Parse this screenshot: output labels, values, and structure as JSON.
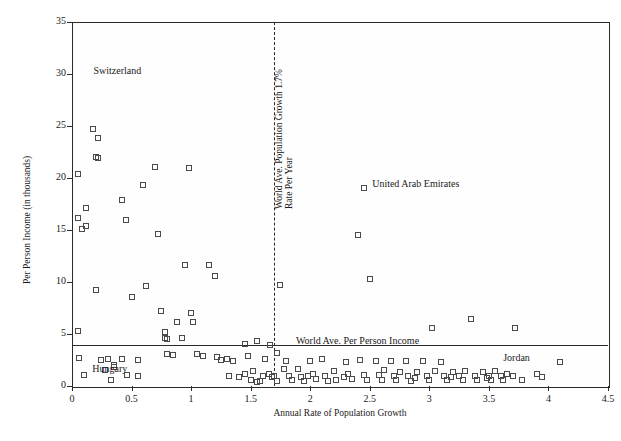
{
  "chart_data": {
    "type": "scatter",
    "title": "",
    "xlabel": "Annual Rate of Population Growth",
    "ylabel": "Per Person Income (in thousands)",
    "xlim": [
      0,
      4.5
    ],
    "ylim": [
      0,
      35
    ],
    "xticks": [
      "0",
      "0.5",
      "1",
      "1.5",
      "2",
      "2.5",
      "3",
      "3.5",
      "4",
      "4.5"
    ],
    "yticks": [
      "0",
      "5",
      "10",
      "15",
      "20",
      "25",
      "30",
      "35"
    ],
    "grid": false,
    "legend": "none",
    "annotations": [
      {
        "text": "Switzerland",
        "x": 0.18,
        "y": 30.2
      },
      {
        "text": "United Arab Emirates",
        "x": 2.52,
        "y": 19.3
      },
      {
        "text": "Hungary",
        "x": 0.17,
        "y": 1.55
      },
      {
        "text": "Jordan",
        "x": 3.62,
        "y": 2.6
      },
      {
        "text": "World Ave. Population Growth 1.7%",
        "x": 1.7,
        "y": 17.0,
        "rotated": true
      },
      {
        "text": "Rate Per Year",
        "x": 1.78,
        "y": 17.0,
        "rotated": true
      },
      {
        "text": "World Ave. Per Person Income",
        "x": 1.88,
        "y": 4.25
      }
    ],
    "reference_lines": [
      {
        "orientation": "vertical",
        "value": 1.7,
        "style": "dashed"
      },
      {
        "orientation": "horizontal",
        "value": 3.9,
        "style": "solid"
      }
    ],
    "points": [
      [
        0.05,
        20.4
      ],
      [
        0.05,
        16.2
      ],
      [
        0.08,
        15.1
      ],
      [
        0.12,
        17.1
      ],
      [
        0.12,
        15.4
      ],
      [
        0.05,
        5.3
      ],
      [
        0.06,
        2.7
      ],
      [
        0.1,
        1.1
      ],
      [
        0.18,
        24.7
      ],
      [
        0.2,
        22.0
      ],
      [
        0.22,
        23.8
      ],
      [
        0.22,
        21.9
      ],
      [
        0.2,
        9.2
      ],
      [
        0.24,
        2.5
      ],
      [
        0.28,
        1.5
      ],
      [
        0.3,
        2.6
      ],
      [
        0.33,
        0.6
      ],
      [
        0.35,
        2.0
      ],
      [
        0.35,
        1.8
      ],
      [
        0.42,
        17.9
      ],
      [
        0.45,
        16.0
      ],
      [
        0.5,
        8.6
      ],
      [
        0.55,
        2.5
      ],
      [
        0.55,
        1.0
      ],
      [
        0.6,
        19.3
      ],
      [
        0.62,
        9.6
      ],
      [
        0.7,
        21.1
      ],
      [
        0.72,
        14.6
      ],
      [
        0.75,
        7.2
      ],
      [
        0.78,
        5.2
      ],
      [
        0.8,
        4.5
      ],
      [
        0.8,
        3.1
      ],
      [
        0.85,
        3.0
      ],
      [
        0.88,
        6.2
      ],
      [
        0.95,
        11.6
      ],
      [
        0.98,
        21.0
      ],
      [
        1.0,
        7.0
      ],
      [
        1.02,
        6.2
      ],
      [
        1.05,
        3.1
      ],
      [
        1.1,
        2.9
      ],
      [
        1.15,
        11.6
      ],
      [
        1.2,
        10.6
      ],
      [
        1.25,
        2.5
      ],
      [
        1.3,
        2.6
      ],
      [
        1.35,
        2.4
      ],
      [
        1.4,
        0.9
      ],
      [
        1.45,
        4.0
      ],
      [
        1.45,
        1.2
      ],
      [
        1.5,
        0.6
      ],
      [
        1.52,
        1.4
      ],
      [
        1.55,
        4.3
      ],
      [
        1.55,
        0.4
      ],
      [
        1.58,
        0.5
      ],
      [
        1.6,
        1.0
      ],
      [
        1.62,
        2.6
      ],
      [
        1.65,
        1.2
      ],
      [
        1.68,
        0.9
      ],
      [
        1.7,
        1.0
      ],
      [
        1.72,
        0.5
      ],
      [
        1.75,
        9.7
      ],
      [
        1.78,
        1.6
      ],
      [
        1.8,
        2.4
      ],
      [
        1.82,
        1.0
      ],
      [
        1.85,
        0.6
      ],
      [
        1.9,
        1.6
      ],
      [
        1.92,
        0.9
      ],
      [
        1.95,
        0.5
      ],
      [
        2.0,
        2.4
      ],
      [
        2.02,
        1.2
      ],
      [
        2.05,
        0.7
      ],
      [
        2.1,
        2.6
      ],
      [
        2.12,
        1.0
      ],
      [
        2.15,
        0.5
      ],
      [
        2.2,
        1.4
      ],
      [
        2.22,
        0.6
      ],
      [
        2.3,
        2.3
      ],
      [
        2.32,
        1.2
      ],
      [
        2.35,
        0.7
      ],
      [
        2.4,
        14.5
      ],
      [
        2.42,
        2.5
      ],
      [
        2.45,
        1.1
      ],
      [
        2.48,
        0.6
      ],
      [
        2.5,
        10.3
      ],
      [
        2.55,
        2.4
      ],
      [
        2.58,
        1.1
      ],
      [
        2.6,
        0.6
      ],
      [
        2.62,
        1.5
      ],
      [
        2.68,
        2.4
      ],
      [
        2.7,
        1.0
      ],
      [
        2.72,
        0.6
      ],
      [
        2.75,
        1.3
      ],
      [
        2.8,
        2.4
      ],
      [
        2.82,
        1.0
      ],
      [
        2.85,
        0.5
      ],
      [
        2.9,
        1.3
      ],
      [
        2.95,
        2.4
      ],
      [
        2.98,
        1.0
      ],
      [
        3.0,
        0.6
      ],
      [
        3.02,
        5.6
      ],
      [
        3.05,
        1.4
      ],
      [
        3.1,
        2.3
      ],
      [
        3.12,
        1.0
      ],
      [
        3.15,
        0.6
      ],
      [
        3.2,
        1.3
      ],
      [
        3.25,
        1.0
      ],
      [
        3.28,
        0.6
      ],
      [
        3.3,
        1.4
      ],
      [
        3.35,
        6.4
      ],
      [
        3.38,
        1.0
      ],
      [
        3.4,
        0.6
      ],
      [
        3.45,
        1.3
      ],
      [
        3.5,
        1.0
      ],
      [
        3.52,
        0.6
      ],
      [
        3.55,
        1.4
      ],
      [
        3.6,
        1.0
      ],
      [
        3.62,
        0.6
      ],
      [
        3.65,
        1.2
      ],
      [
        3.7,
        1.0
      ],
      [
        3.72,
        5.6
      ],
      [
        3.78,
        0.6
      ],
      [
        3.9,
        1.2
      ],
      [
        3.95,
        0.9
      ],
      [
        4.1,
        2.3
      ],
      [
        2.45,
        19.0
      ],
      [
        0.92,
        4.6
      ],
      [
        0.78,
        4.6
      ],
      [
        1.48,
        2.9
      ],
      [
        1.98,
        1.0
      ],
      [
        2.28,
        0.9
      ],
      [
        0.42,
        2.6
      ],
      [
        0.46,
        1.1
      ],
      [
        1.22,
        2.8
      ],
      [
        1.32,
        1.0
      ],
      [
        2.88,
        0.8
      ],
      [
        3.18,
        0.9
      ],
      [
        3.48,
        0.8
      ],
      [
        1.66,
        3.9
      ],
      [
        1.72,
        3.2
      ]
    ]
  }
}
